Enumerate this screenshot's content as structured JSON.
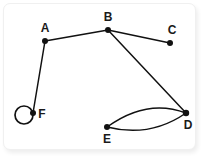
{
  "figure": {
    "type": "undirected-multigraph-node-link-diagram",
    "background_color": "#ffffff",
    "edge_color": "#111111",
    "node_color": "#111111",
    "label_color": "#1a1a1a",
    "width": 203,
    "height": 157
  },
  "nodes": [
    {
      "id": "A",
      "label": "A",
      "cx": 45,
      "cy": 41,
      "r": 3.0,
      "label_x": 45,
      "label_y": 29
    },
    {
      "id": "B",
      "label": "B",
      "cx": 108,
      "cy": 30,
      "r": 3.0,
      "label_x": 108,
      "label_y": 18
    },
    {
      "id": "C",
      "label": "C",
      "cx": 170,
      "cy": 43,
      "r": 3.0,
      "label_x": 172,
      "label_y": 31
    },
    {
      "id": "D",
      "label": "D",
      "cx": 186,
      "cy": 113,
      "r": 3.2,
      "label_x": 188,
      "label_y": 126
    },
    {
      "id": "E",
      "label": "E",
      "cx": 107,
      "cy": 127,
      "r": 3.0,
      "label_x": 107,
      "label_y": 140
    },
    {
      "id": "F",
      "label": "F",
      "cx": 33,
      "cy": 113,
      "r": 3.0,
      "label_x": 42,
      "label_y": 115
    }
  ],
  "edges": [
    {
      "id": "edge-a-b",
      "from": "A",
      "to": "B",
      "shape": "straight",
      "path": "M 45 41 L 108 30"
    },
    {
      "id": "edge-b-c",
      "from": "B",
      "to": "C",
      "shape": "straight",
      "path": "M 108 30 L 170 43"
    },
    {
      "id": "edge-b-d",
      "from": "B",
      "to": "D",
      "shape": "straight",
      "path": "M 108 30 L 186 113"
    },
    {
      "id": "edge-a-f",
      "from": "A",
      "to": "F",
      "shape": "straight",
      "path": "M 45 41 L 33 113"
    },
    {
      "id": "edge-e-d-upper",
      "from": "E",
      "to": "D",
      "shape": "curved-upper",
      "path": "M 107 127 Q 147 98 186 113"
    },
    {
      "id": "edge-e-d-lower",
      "from": "E",
      "to": "D",
      "shape": "curved-lower",
      "path": "M 107 127 Q 150 138 186 113"
    }
  ],
  "self_loops": [
    {
      "id": "loop-f",
      "at": "F",
      "cx": 24,
      "cy": 115,
      "r": 9.0
    }
  ],
  "chart_data": {
    "type": "graph",
    "title": "",
    "node_ids": [
      "A",
      "B",
      "C",
      "D",
      "E",
      "F"
    ],
    "edge_list": [
      [
        "A",
        "B"
      ],
      [
        "B",
        "C"
      ],
      [
        "B",
        "D"
      ],
      [
        "A",
        "F"
      ],
      [
        "E",
        "D"
      ],
      [
        "E",
        "D"
      ],
      [
        "F",
        "F"
      ]
    ],
    "degrees": {
      "A": 2,
      "B": 3,
      "C": 1,
      "D": 3,
      "E": 2,
      "F": 3
    }
  }
}
